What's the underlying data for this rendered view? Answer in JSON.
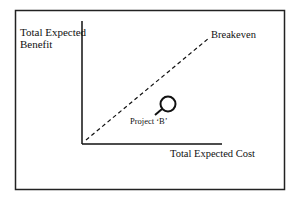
{
  "diagram": {
    "frame": {
      "x": 15,
      "y": 10,
      "width": 269,
      "height": 179
    },
    "axes": {
      "origin": {
        "x": 82,
        "y": 144
      },
      "y_top": 21,
      "x_right": 222,
      "y_label_line1": "Total Expected",
      "y_label_line2": "Benefit",
      "x_label": "Total Expected Cost"
    },
    "breakeven": {
      "label": "Breakeven",
      "start": {
        "x": 86,
        "y": 140
      },
      "end": {
        "x": 209,
        "y": 38
      },
      "style": "dashed"
    },
    "project": {
      "label": "Project ‘B’",
      "marker": {
        "cx": 168,
        "cy": 104,
        "r": 8
      },
      "leader_start": {
        "x": 155,
        "y": 115
      },
      "leader_end": {
        "x": 162,
        "y": 109
      }
    },
    "colors": {
      "ink": "#111111",
      "background": "#ffffff"
    }
  }
}
